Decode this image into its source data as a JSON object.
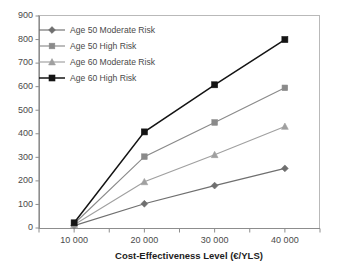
{
  "chart_data": {
    "type": "line",
    "title": "",
    "subtitle": "",
    "xlabel": "Cost-Effectiveness Level (€/YLS)",
    "ylabel": "",
    "x": [
      10000,
      20000,
      30000,
      40000
    ],
    "xtick_labels": [
      "10 000",
      "20 000",
      "30 000",
      "40 000"
    ],
    "ytick_labels": [
      "0",
      "100",
      "200",
      "300",
      "400",
      "500",
      "600",
      "700",
      "800",
      "900"
    ],
    "ylim": [
      0,
      900
    ],
    "xlim": [
      5000,
      45000
    ],
    "ytick_step": 100,
    "grid": false,
    "legend_position": "top-left",
    "minor_xticks": true,
    "series": [
      {
        "name": "Age 50 Moderate Risk",
        "marker": "diamond",
        "color": "#6f6f6f",
        "values": [
          10,
          103,
          180,
          253
        ]
      },
      {
        "name": "Age 50 High Risk",
        "marker": "square",
        "color": "#8a8a8a",
        "values": [
          18,
          303,
          448,
          595
        ]
      },
      {
        "name": "Age 60 Moderate Risk",
        "marker": "triangle",
        "color": "#a0a0a0",
        "values": [
          14,
          196,
          311,
          431
        ]
      },
      {
        "name": "Age 60 High Risk",
        "marker": "square-filled",
        "color": "#141414",
        "values": [
          22,
          408,
          608,
          800
        ]
      }
    ]
  },
  "axis": {
    "y_axis_name": "y-axis",
    "x_axis_name": "x-axis"
  },
  "legend": {
    "items": [
      {
        "label": "Age 50 Moderate Risk"
      },
      {
        "label": "Age 50 High Risk"
      },
      {
        "label": "Age 60 Moderate Risk"
      },
      {
        "label": "Age 60 High Risk"
      }
    ]
  }
}
